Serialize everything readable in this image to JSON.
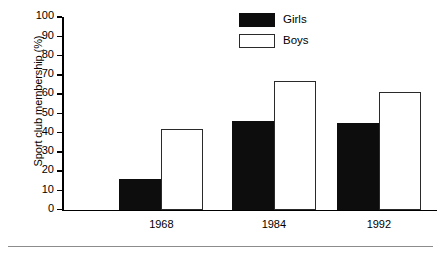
{
  "chart_data": {
    "type": "bar",
    "title": "",
    "xlabel": "",
    "ylabel": "Sport club membership (%)",
    "categories": [
      "1968",
      "1984",
      "1992"
    ],
    "series": [
      {
        "name": "Girls",
        "color": "#0d0d0d",
        "values": [
          16,
          46,
          45
        ]
      },
      {
        "name": "Boys",
        "color": "#ffffff",
        "values": [
          42,
          67,
          61
        ]
      }
    ],
    "ylim": [
      0,
      100
    ],
    "ytick_step": 10,
    "yticks": [
      0,
      10,
      20,
      30,
      40,
      50,
      60,
      70,
      80,
      90,
      100
    ],
    "ytick_labels": [
      "0",
      "10",
      "20",
      "30",
      "40",
      "50",
      "60",
      "70",
      "80",
      "90",
      "100"
    ],
    "grid": false,
    "legend_position": "top-right",
    "legend": [
      {
        "label": "Girls",
        "swatch": "filled-black"
      },
      {
        "label": "Boys",
        "swatch": "outlined-white"
      }
    ]
  }
}
